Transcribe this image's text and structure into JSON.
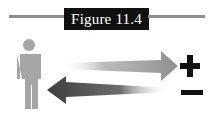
{
  "figure": {
    "title": "Figure 11.4"
  },
  "diagram": {
    "person_icon": "person-silhouette-icon",
    "arrows": [
      {
        "direction": "right",
        "label": "outgoing-arrow",
        "color": "#9a9a9a"
      },
      {
        "direction": "left",
        "label": "incoming-arrow",
        "color": "#555555"
      }
    ],
    "symbols": [
      {
        "glyph": "+",
        "name": "plus-sign"
      },
      {
        "glyph": "−",
        "name": "minus-sign"
      }
    ]
  },
  "colors": {
    "title_bg": "#111111",
    "rule": "#8e8e8e",
    "person": "#a6a6a6",
    "symbol": "#111111"
  }
}
